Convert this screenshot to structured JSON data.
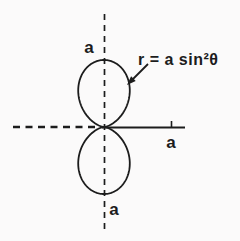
{
  "figure": {
    "equation": {
      "label": "r = a sin²θ"
    },
    "labels": {
      "a_top": "a",
      "a_right": "a",
      "a_bottom": "a"
    },
    "curve": {
      "type": "polar",
      "equation_plain": "r = a*sin^2(theta)",
      "a_px": 67,
      "origin_x": 104,
      "origin_y": 127
    },
    "colors": {
      "ink": "#1c1c1c",
      "paper": "#fbfafa"
    }
  }
}
